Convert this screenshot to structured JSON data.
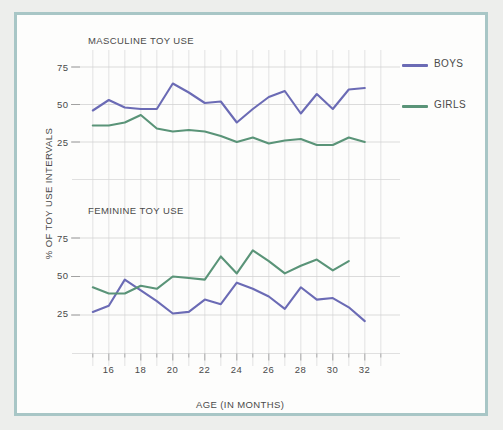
{
  "figure": {
    "background_color": "#edeeec",
    "frame_color": "#a8c6c6",
    "plot_background": "#fdfdfc"
  },
  "axis": {
    "ylabel": "% OF TOY USE INTERVALS",
    "xlabel": "AGE (IN MONTHS)",
    "ytick_labels": [
      "25",
      "50",
      "75"
    ],
    "xtick_labels": [
      "16",
      "18",
      "20",
      "22",
      "24",
      "26",
      "28",
      "30",
      "32"
    ]
  },
  "legend": {
    "position": "right",
    "entries": [
      {
        "label": "BOYS",
        "color": "#6b6bb5"
      },
      {
        "label": "GIRLS",
        "color": "#5a9478"
      }
    ]
  },
  "panels": [
    {
      "id": "masculine",
      "title": "MASCULINE TOY USE"
    },
    {
      "id": "feminine",
      "title": "FEMININE TOY USE"
    }
  ],
  "chart_data": [
    {
      "type": "line",
      "title": "MASCULINE TOY USE",
      "xlabel": "AGE (IN MONTHS)",
      "ylabel": "% OF TOY USE INTERVALS",
      "x": [
        15,
        16,
        17,
        18,
        19,
        20,
        21,
        22,
        23,
        24,
        25,
        26,
        27,
        28,
        29,
        30,
        31,
        32
      ],
      "xlim": [
        14.2,
        33.2
      ],
      "ylim": [
        0,
        82
      ],
      "yticks": [
        25,
        50,
        75
      ],
      "xticks": [
        16,
        18,
        20,
        22,
        24,
        26,
        28,
        30,
        32
      ],
      "grid": true,
      "series": [
        {
          "name": "BOYS",
          "color": "#6b6bb5",
          "values": [
            46,
            53,
            48,
            47,
            47,
            64,
            58,
            51,
            52,
            38,
            47,
            55,
            59,
            44,
            57,
            47,
            60,
            61
          ]
        },
        {
          "name": "GIRLS",
          "color": "#5a9478",
          "values": [
            36,
            36,
            38,
            43,
            34,
            32,
            33,
            32,
            29,
            25,
            28,
            24,
            26,
            27,
            23,
            23,
            28,
            25
          ]
        }
      ]
    },
    {
      "type": "line",
      "title": "FEMININE TOY USE",
      "xlabel": "AGE (IN MONTHS)",
      "ylabel": "% OF TOY USE INTERVALS",
      "x": [
        15,
        16,
        17,
        18,
        19,
        20,
        21,
        22,
        23,
        24,
        25,
        26,
        27,
        28,
        29,
        30,
        31,
        32
      ],
      "xlim": [
        14.2,
        33.2
      ],
      "ylim": [
        0,
        82
      ],
      "yticks": [
        25,
        50,
        75
      ],
      "xticks": [
        16,
        18,
        20,
        22,
        24,
        26,
        28,
        30,
        32
      ],
      "grid": true,
      "series": [
        {
          "name": "BOYS",
          "color": "#6b6bb5",
          "values": [
            27,
            31,
            48,
            41,
            34,
            26,
            27,
            35,
            32,
            46,
            42,
            37,
            29,
            43,
            35,
            36,
            30,
            21
          ]
        },
        {
          "name": "GIRLS",
          "color": "#5a9478",
          "values": [
            43,
            39,
            39,
            44,
            42,
            50,
            49,
            48,
            63,
            52,
            67,
            60,
            52,
            57,
            61,
            54,
            60,
            null
          ]
        }
      ]
    }
  ]
}
